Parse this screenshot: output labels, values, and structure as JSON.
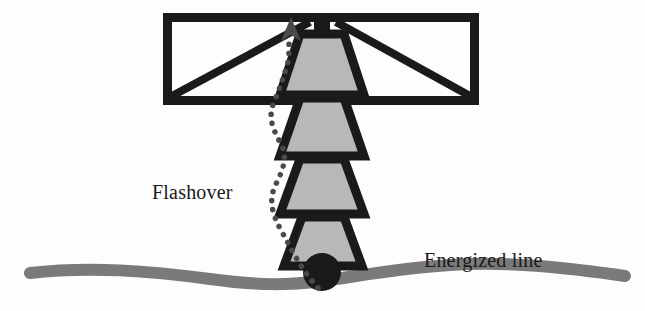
{
  "figure": {
    "background_color": "#fdfdfd"
  },
  "labels": {
    "flashover": "Flashover",
    "energized_line": "Energized line"
  },
  "colors": {
    "outline": "#1a1a1a",
    "insulator_fill": "#b8b8b8",
    "conductor": "#7a7a7a",
    "arc_dots": "#4a4a4a",
    "text": "#1a1a1a"
  },
  "components": {
    "crossarm": {
      "name": "crossarm-frame",
      "left": 163,
      "top": 13,
      "right": 478,
      "bottom": 104,
      "stroke_width": 9,
      "braces": 2
    },
    "insulator_string": {
      "name": "insulator-disc-stack",
      "disc_count": 4,
      "center_x": 322,
      "top": 30,
      "bottom": 265,
      "fill": "#b8b8b8",
      "outline": "#1a1a1a"
    },
    "hanger": {
      "name": "hanger-stem",
      "center_x": 322,
      "top": 13,
      "bottom": 32
    },
    "conductor": {
      "name": "energized-conductor-line",
      "start_x": 30,
      "end_x": 625,
      "thickness": 11,
      "color": "#7a7a7a"
    },
    "clamp": {
      "name": "conductor-clamp",
      "center_x": 322,
      "center_y": 270,
      "radius": 18,
      "color": "#1a1a1a"
    },
    "flashover_arc": {
      "name": "flashover-arc-path",
      "style": "dotted",
      "dot_size": 5,
      "from": "conductor-clamp",
      "to": "crossarm",
      "arrowhead": "up"
    }
  }
}
